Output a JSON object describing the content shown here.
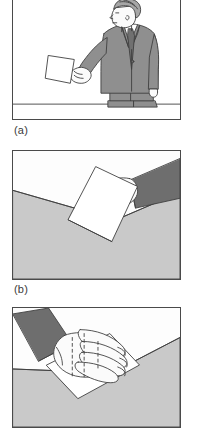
{
  "figure": {
    "panel_count": 3,
    "style": "grayscale line drawing",
    "captions": {
      "a": "(a)",
      "b": "(b)",
      "c": "(c)"
    },
    "panels": [
      {
        "id": "a",
        "label": "(a)",
        "description": "Man in suit standing, offering a card held in his extended hand",
        "elements": [
          "man-figure",
          "suit-jacket",
          "shirt",
          "necktie",
          "head",
          "hair",
          "extended-arm",
          "hand",
          "business-card",
          "ground-line"
        ]
      },
      {
        "id": "b",
        "label": "(b)",
        "description": "Close-up of a hand in a dark sleeve holding a card above a table corner",
        "elements": [
          "dark-sleeve",
          "hand",
          "thumb",
          "fingers",
          "business-card",
          "table-surface",
          "table-edge"
        ]
      },
      {
        "id": "c",
        "label": "(c)",
        "description": "Close-up of a hand with fingers spread over a card resting on a surface",
        "elements": [
          "dark-sleeve",
          "hand",
          "fingers",
          "business-card",
          "hidden-card-outline",
          "table-surface",
          "table-edge"
        ]
      }
    ]
  },
  "colors": {
    "outline": "#3f3f3f",
    "panel_border": "#4a4a4a",
    "suit_gray": "#8f8f8f",
    "suit_shadow": "#777777",
    "sleeve_dark": "#6e6e6e",
    "skin": "#fbfbfb",
    "card_white": "#ffffff",
    "surface_gray": "#c9c9c9",
    "surface_light": "#fdfdfd",
    "hair_gray": "#a6a6a6",
    "tie_dark": "#707070",
    "caption_text": "#3a3a3a",
    "background": "#ffffff"
  }
}
